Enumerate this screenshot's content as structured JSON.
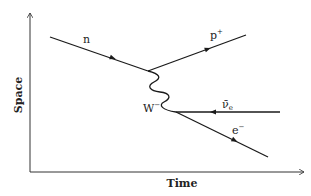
{
  "diagram": {
    "type": "feynman-diagram",
    "process": "beta decay",
    "axes": {
      "x_label": "Time",
      "y_label": "Space"
    },
    "particles": {
      "neutron": "n",
      "proton": "p",
      "proton_charge": "+",
      "w_boson": "W",
      "w_charge": "−",
      "antineutrino": "ν̄",
      "antineutrino_sub": "e",
      "electron": "e",
      "electron_charge": "−"
    },
    "colors": {
      "line": "#1a1a1a",
      "axis": "#333333",
      "background": "#ffffff"
    }
  }
}
